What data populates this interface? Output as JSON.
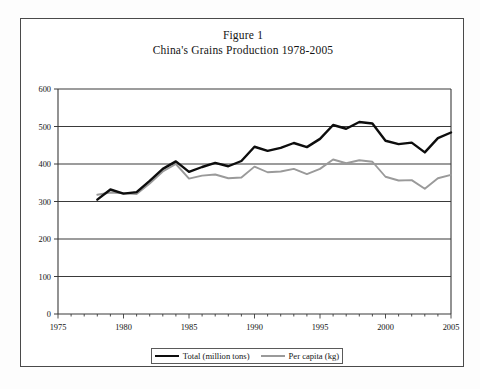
{
  "figure": {
    "title_line1": "Figure 1",
    "title_line2": "China's Grains Production 1978-2005"
  },
  "legend": {
    "series1_label": "Total (million tons)",
    "series2_label": "Per capita (kg)"
  },
  "colors": {
    "total_line": "#0d0d0d",
    "per_capita_line": "#9a9a9a",
    "gridline": "#3a3a3a",
    "frame": "#4a4a4a",
    "background": "#ffffff"
  },
  "chart_data": {
    "type": "line",
    "xlabel": "",
    "ylabel": "",
    "xlim": [
      1975,
      2005
    ],
    "ylim": [
      0,
      600
    ],
    "xticks": [
      1975,
      1980,
      1985,
      1990,
      1995,
      2000,
      2005
    ],
    "yticks": [
      0,
      100,
      200,
      300,
      400,
      500,
      600
    ],
    "minor_xticks_every": 1,
    "grid": "horizontal",
    "legend_position": "bottom",
    "x": [
      1978,
      1979,
      1980,
      1981,
      1982,
      1983,
      1984,
      1985,
      1986,
      1987,
      1988,
      1989,
      1990,
      1991,
      1992,
      1993,
      1994,
      1995,
      1996,
      1997,
      1998,
      1999,
      2000,
      2001,
      2002,
      2003,
      2004,
      2005
    ],
    "series": [
      {
        "name": "Total (million tons)",
        "units": "million tons",
        "color": "#0d0d0d",
        "values": [
          305,
          332,
          321,
          325,
          355,
          387,
          407,
          379,
          392,
          403,
          394,
          408,
          446,
          435,
          443,
          456,
          445,
          467,
          504,
          494,
          512,
          508,
          462,
          453,
          457,
          431,
          469,
          484
        ]
      },
      {
        "name": "Per capita (kg)",
        "units": "kg",
        "color": "#9a9a9a",
        "values": [
          318,
          324,
          322,
          320,
          348,
          380,
          400,
          361,
          369,
          372,
          362,
          364,
          393,
          378,
          380,
          387,
          373,
          387,
          412,
          402,
          410,
          406,
          366,
          356,
          357,
          334,
          362,
          371
        ]
      }
    ]
  }
}
